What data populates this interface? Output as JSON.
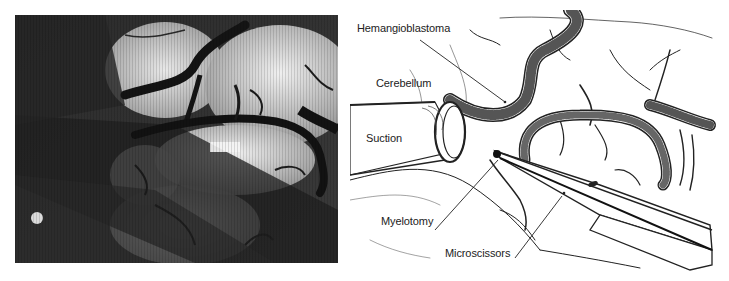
{
  "figure": {
    "photo_panel": {
      "description": "Intraoperative microscope photograph of cerebellar surface with vessels, suction and microscissors",
      "colors": {
        "dark": "#1e1e1e",
        "mid": "#6a6a6a",
        "light": "#d8d8d8",
        "vessel": "#151515"
      }
    },
    "illustration_panel": {
      "labels": {
        "hemangioblastoma": "Hemangioblastoma",
        "cerebellum": "Cerebellum",
        "suction": "Suction",
        "myelotomy": "Myelotomy",
        "microscissors": "Microscissors"
      },
      "colors": {
        "line": "#222222",
        "background": "#ffffff",
        "text": "#222222"
      }
    }
  }
}
